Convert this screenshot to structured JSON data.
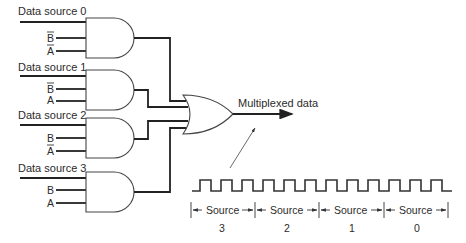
{
  "diagram": {
    "and_gates": [
      {
        "id": "gate-0",
        "data_label": "Data source 0",
        "inputs": [
          "B̄",
          "Ā"
        ],
        "inputs_bar": [
          true,
          true
        ],
        "inputs_letter": [
          "B",
          "A"
        ]
      },
      {
        "id": "gate-1",
        "data_label": "Data source 1",
        "inputs": [
          "B̄",
          "A"
        ],
        "inputs_bar": [
          true,
          false
        ],
        "inputs_letter": [
          "B",
          "A"
        ]
      },
      {
        "id": "gate-2",
        "data_label": "Data source 2",
        "inputs": [
          "B",
          "Ā"
        ],
        "inputs_bar": [
          false,
          true
        ],
        "inputs_letter": [
          "B",
          "A"
        ]
      },
      {
        "id": "gate-3",
        "data_label": "Data source 3",
        "inputs": [
          "B",
          "A"
        ],
        "inputs_bar": [
          false,
          false
        ],
        "inputs_letter": [
          "B",
          "A"
        ]
      }
    ],
    "or_gate": {
      "id": "or-gate"
    },
    "output_label": "Multiplexed data",
    "waveform": {
      "pulses": 12,
      "segments": [
        {
          "label": "Source",
          "number": "3"
        },
        {
          "label": "Source",
          "number": "2"
        },
        {
          "label": "Source",
          "number": "1"
        },
        {
          "label": "Source",
          "number": "0"
        }
      ]
    }
  }
}
